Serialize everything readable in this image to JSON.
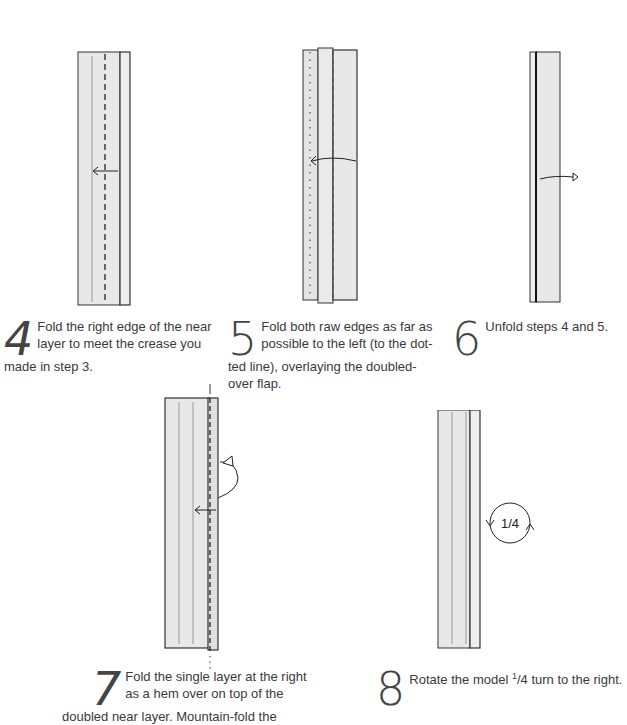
{
  "steps": [
    {
      "number": "4",
      "text": "Fold the right edge of the near layer to meet the crease you made in step 3."
    },
    {
      "number": "5",
      "text": "Fold both raw edges as far as possible to the left (to the dotted line), overlaying the doubled-over flap.",
      "lines": [
        "Fold both raw edges as far as",
        "possible to the left (to the dot-",
        "ted line), overlaying the doubled-",
        "over flap."
      ]
    },
    {
      "number": "6",
      "text": "Unfold steps 4 and 5."
    },
    {
      "number": "7",
      "lines": [
        "Fold the single layer at the right",
        "as a hem over on top of the",
        "doubled near layer. Mountain-fold the"
      ]
    },
    {
      "number": "8",
      "text_before": "Rotate the model ",
      "fraction_num": "1",
      "fraction_den": "/4",
      "text_after": " turn to the right."
    }
  ],
  "s4": {
    "l1": "Fold the right edge of the near",
    "l2": "layer to meet the crease you",
    "l3": "made in step 3."
  },
  "rotation_label": "1/4",
  "colors": {
    "paper": "#e8e8e8",
    "edge": "#333333",
    "crease": "#9a9a9a"
  }
}
